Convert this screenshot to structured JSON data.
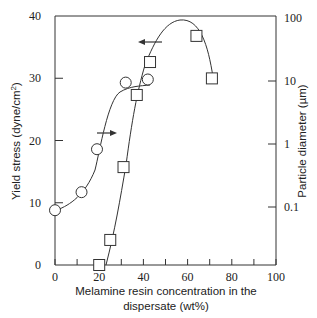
{
  "chart_data": {
    "type": "scatter",
    "title": "",
    "xlabel": "Melamine resin concentration in the dispersate (wt%)",
    "xlabel_lines": [
      "Melamine resin concentration in the",
      "dispersate (wt%)"
    ],
    "ylabel": "Yield stress (dyne/cm²)",
    "ylabel_text": "Yield stress (dyne/cm",
    "ylabel_sup": "2",
    "ylabel_end": ")",
    "y2label": "Particle diameter (µm)",
    "xlim": [
      0,
      100
    ],
    "ylim": [
      0,
      40
    ],
    "y2lim": [
      0.01,
      100
    ],
    "y2scale": "log",
    "x_ticks": [
      0,
      20,
      40,
      60,
      80,
      100
    ],
    "x_tick_labels": [
      "0",
      "20",
      "40",
      "60",
      "80",
      "100"
    ],
    "x_minor_ticks": [
      10,
      30,
      50,
      70,
      90
    ],
    "y_ticks": [
      0,
      10,
      20,
      30,
      40
    ],
    "y_tick_labels": [
      "0",
      "10",
      "20",
      "30",
      "40"
    ],
    "y2_ticks": [
      0.1,
      1,
      10,
      100
    ],
    "y2_tick_labels": [
      "0.1",
      "1",
      "10",
      "100"
    ],
    "grid": false,
    "series": [
      {
        "name": "Yield stress",
        "marker": "circle",
        "axis": "left",
        "x": [
          0,
          12,
          19,
          32,
          42
        ],
        "y": [
          8.8,
          11.7,
          18.6,
          29.3,
          29.8
        ]
      },
      {
        "name": "Particle diameter",
        "marker": "square",
        "axis": "right",
        "x": [
          20,
          25,
          31,
          37,
          43,
          64,
          71
        ],
        "y": [
          0.01,
          0.03,
          0.43,
          6,
          20,
          52,
          11
        ]
      }
    ],
    "annotations": [
      {
        "type": "arrow",
        "direction": "left",
        "note": "square series refers to right axis"
      },
      {
        "type": "arrow",
        "direction": "right",
        "note": "circle series refers to left axis"
      }
    ]
  }
}
